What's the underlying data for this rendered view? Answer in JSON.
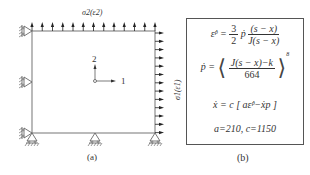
{
  "figure_a": {
    "caption": "(a)",
    "top_load_label": "σ2(ε2)",
    "right_load_label": "σ1(ε1)",
    "axis_1_label": "1",
    "axis_2_label": "2",
    "top_arrow_count": 13,
    "right_arrow_count": 13,
    "left_roller_supports": 3,
    "bottom_roller_supports": 3
  },
  "figure_b": {
    "caption": "(b)",
    "eq1": {
      "lhs": "ε̇ᵖ =",
      "coef_num": "3",
      "coef_den": "2",
      "p": "ṗ",
      "num": "(s − x)",
      "den": "J(s − x)"
    },
    "eq2": {
      "lhs": "ṗ =",
      "num": "J(s − x)−k",
      "den": "664",
      "exponent": "8"
    },
    "eq3": "ẋ = c [ aε̇ᵖ−ẋp ]",
    "eq4": "a=210, c=1150"
  },
  "colors": {
    "line": "#555555",
    "arrow": "#222222",
    "text": "#333333"
  }
}
